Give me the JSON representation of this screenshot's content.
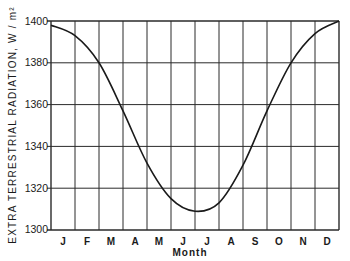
{
  "chart_data": {
    "type": "line",
    "title": "",
    "xlabel": "Month",
    "ylabel": "EXTRA TERRESTRIAL  RADIATION,  W / m²",
    "x_tick_labels": [
      "J",
      "F",
      "M",
      "A",
      "M",
      "J",
      "J",
      "A",
      "S",
      "O",
      "N",
      "D"
    ],
    "y_tick_labels": [
      "1400",
      "1380",
      "1360",
      "1340",
      "1320",
      "1300"
    ],
    "ylim": [
      1300,
      1400
    ],
    "y_ticks": [
      1300,
      1320,
      1340,
      1360,
      1380,
      1400
    ],
    "grid": true,
    "legend": null,
    "series": [
      {
        "name": "Extraterrestrial radiation",
        "x_month_boundary": [
          0,
          1,
          2,
          3,
          4,
          5,
          6,
          7,
          8,
          9,
          10,
          11,
          12
        ],
        "values": [
          1398,
          1393,
          1380,
          1357,
          1332,
          1315,
          1309,
          1313,
          1331,
          1357,
          1380,
          1394,
          1400
        ]
      }
    ],
    "annotations": [
      "Minimum ≈ 1308 W/m² in early July",
      "Maximum ≈ 1400 W/m² in early January"
    ]
  },
  "axes": {
    "ylabel": "EXTRA TERRESTRIAL  RADIATION,  W / m²",
    "xlabel": "Month",
    "months": [
      "J",
      "F",
      "M",
      "A",
      "M",
      "J",
      "J",
      "A",
      "S",
      "O",
      "N",
      "D"
    ],
    "yticks": [
      "1400",
      "1380",
      "1360",
      "1340",
      "1320",
      "1300"
    ]
  },
  "colors": {
    "line": "#1a1a1a",
    "grid": "#2a2a2a",
    "background": "#ffffff"
  }
}
